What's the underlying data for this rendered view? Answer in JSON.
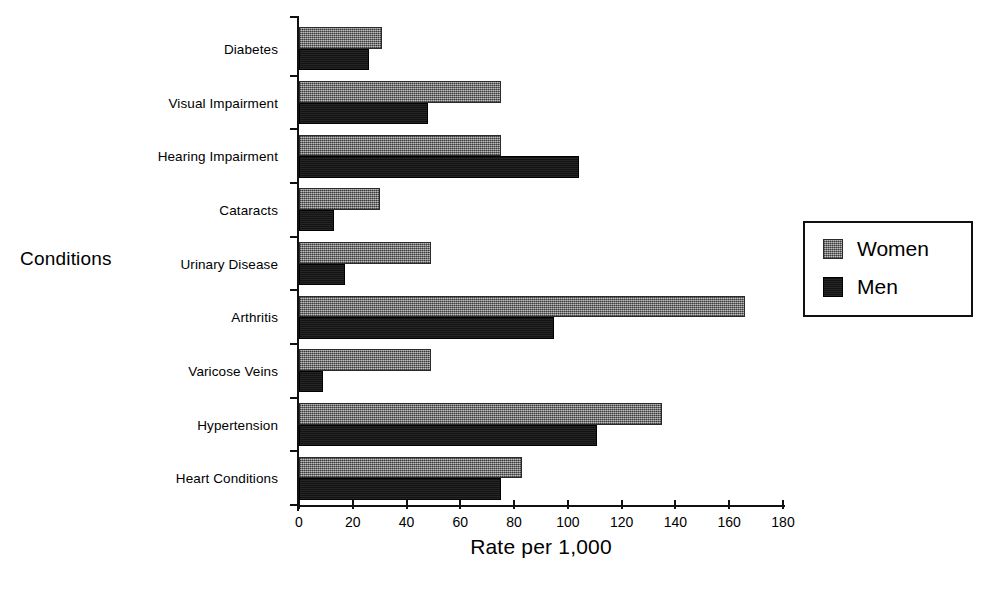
{
  "chart_data": {
    "type": "bar",
    "orientation": "horizontal",
    "title": "",
    "xlabel": "Rate per 1,000",
    "ylabel": "Conditions",
    "xlim": [
      0,
      180
    ],
    "xticks": [
      0,
      20,
      40,
      60,
      80,
      100,
      120,
      140,
      160,
      180
    ],
    "grid": false,
    "legend_position": "right",
    "categories": [
      "Diabetes",
      "Visual Impairment",
      "Hearing Impairment",
      "Cataracts",
      "Urinary Disease",
      "Arthritis",
      "Varicose Veins",
      "Hypertension",
      "Heart Conditions"
    ],
    "series": [
      {
        "name": "Women",
        "color": "#7a7a7a",
        "values": [
          31,
          75,
          75,
          30,
          49,
          166,
          49,
          135,
          83
        ]
      },
      {
        "name": "Men",
        "color": "#141414",
        "values": [
          26,
          48,
          104,
          13,
          17,
          95,
          9,
          111,
          75
        ]
      }
    ]
  },
  "legend": {
    "items": [
      {
        "label": "Women",
        "swatch": "women-swatch"
      },
      {
        "label": "Men",
        "swatch": "men-swatch"
      }
    ]
  }
}
